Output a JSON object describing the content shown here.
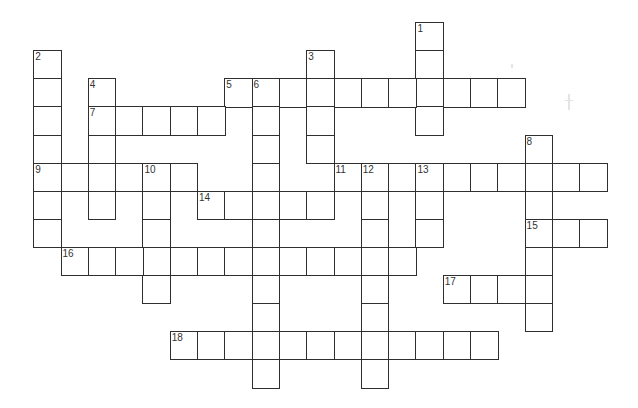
{
  "puzzle": {
    "type": "crossword",
    "grid": {
      "cols": 21,
      "rows": 13,
      "origin_x": 34,
      "origin_y": 23,
      "cell_w": 27.3,
      "cell_h": 28.08
    },
    "colors": {
      "line": "#2f2f2f",
      "number": "#333333",
      "background": "#ffffff"
    },
    "entries": [
      {
        "number": "1",
        "direction": "down",
        "row": 0,
        "col": 14,
        "length": 4
      },
      {
        "number": "2",
        "direction": "down",
        "row": 1,
        "col": 0,
        "length": 7
      },
      {
        "number": "3",
        "direction": "down",
        "row": 1,
        "col": 10,
        "length": 4
      },
      {
        "number": "4",
        "direction": "down",
        "row": 2,
        "col": 2,
        "length": 5
      },
      {
        "number": "5",
        "direction": "across",
        "row": 2,
        "col": 7,
        "length": 11
      },
      {
        "number": "6",
        "direction": "down",
        "row": 2,
        "col": 8,
        "length": 11
      },
      {
        "number": "7",
        "direction": "across",
        "row": 3,
        "col": 2,
        "length": 5
      },
      {
        "number": "8",
        "direction": "down",
        "row": 4,
        "col": 18,
        "length": 7
      },
      {
        "number": "9",
        "direction": "across",
        "row": 5,
        "col": 0,
        "length": 6
      },
      {
        "number": "10",
        "direction": "down",
        "row": 5,
        "col": 4,
        "length": 5
      },
      {
        "number": "11",
        "direction": "across",
        "row": 5,
        "col": 11,
        "length": 10
      },
      {
        "number": "12",
        "direction": "down",
        "row": 5,
        "col": 12,
        "length": 8
      },
      {
        "number": "13",
        "direction": "down",
        "row": 5,
        "col": 14,
        "length": 3
      },
      {
        "number": "14",
        "direction": "across",
        "row": 6,
        "col": 6,
        "length": 5
      },
      {
        "number": "15",
        "direction": "across",
        "row": 7,
        "col": 18,
        "length": 3
      },
      {
        "number": "16",
        "direction": "across",
        "row": 8,
        "col": 1,
        "length": 13
      },
      {
        "number": "17",
        "direction": "across",
        "row": 9,
        "col": 15,
        "length": 4
      },
      {
        "number": "18",
        "direction": "across",
        "row": 11,
        "col": 5,
        "length": 12
      }
    ]
  }
}
